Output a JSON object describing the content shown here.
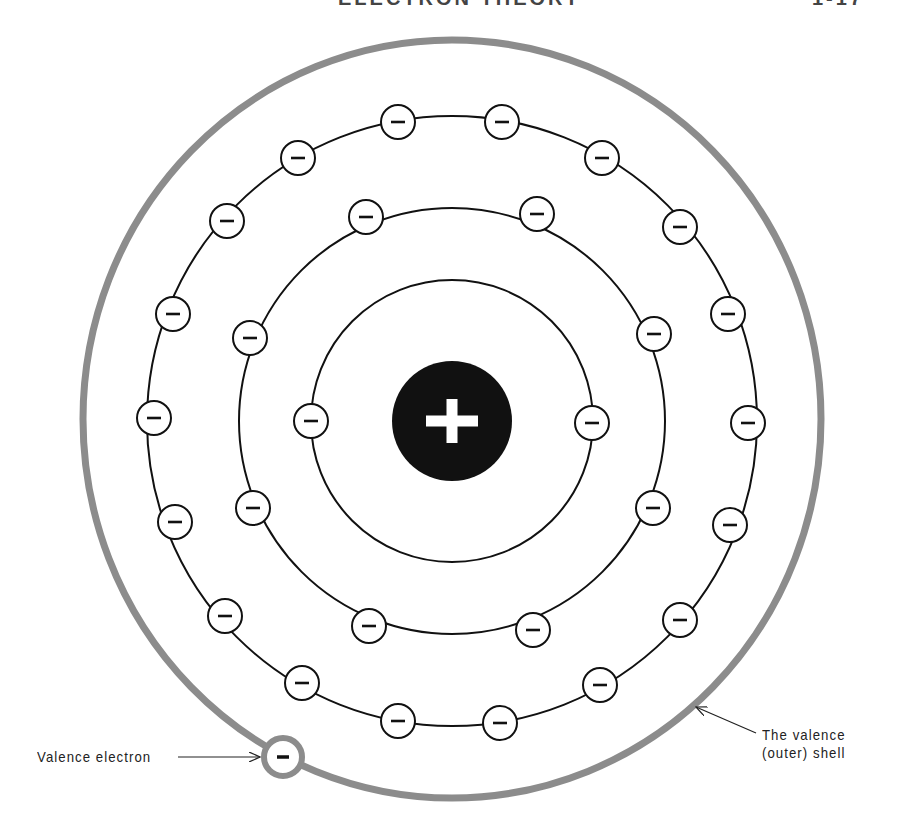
{
  "header": {
    "title": "ELECTRON THEORY",
    "page": "1-17"
  },
  "diagram": {
    "nucleus": {
      "cx": 452,
      "cy": 421,
      "r": 60,
      "symbol": "+",
      "fill": "#111111",
      "symbol_color": "#ffffff"
    },
    "shells": [
      {
        "name": "first-shell",
        "cx": 452,
        "cy": 421,
        "r": 141,
        "stroke": "#111111",
        "stroke_width": 2
      },
      {
        "name": "second-shell",
        "cx": 452,
        "cy": 421,
        "r": 213,
        "stroke": "#111111",
        "stroke_width": 2
      },
      {
        "name": "third-shell",
        "cx": 452,
        "cy": 421,
        "r": 305,
        "stroke": "#111111",
        "stroke_width": 2
      }
    ],
    "valence_shell": {
      "cx": 452,
      "cy": 419,
      "rx": 369,
      "ry": 379,
      "stroke": "#8c8c8c",
      "stroke_width": 7
    },
    "electron_radius": 17,
    "electron_symbol": "−",
    "electrons": {
      "first": [
        [
          311,
          421
        ],
        [
          592,
          423
        ]
      ],
      "second": [
        [
          366,
          217
        ],
        [
          537,
          214
        ],
        [
          250,
          338
        ],
        [
          654,
          334
        ],
        [
          253,
          508
        ],
        [
          653,
          508
        ],
        [
          369,
          626
        ],
        [
          533,
          630
        ]
      ],
      "third": [
        [
          398,
          122
        ],
        [
          502,
          122
        ],
        [
          298,
          158
        ],
        [
          602,
          158
        ],
        [
          227,
          221
        ],
        [
          680,
          227
        ],
        [
          173,
          314
        ],
        [
          728,
          314
        ],
        [
          154,
          418
        ],
        [
          748,
          423
        ],
        [
          175,
          522
        ],
        [
          730,
          525
        ],
        [
          225,
          616
        ],
        [
          680,
          620
        ],
        [
          302,
          683
        ],
        [
          600,
          685
        ],
        [
          398,
          721
        ],
        [
          500,
          723
        ]
      ]
    },
    "valence_electron": {
      "cx": 283,
      "cy": 757,
      "r": 19,
      "ring_color": "#8c8c8c",
      "ring_width": 6
    },
    "counts": {
      "first_shell": 2,
      "second_shell": 8,
      "third_shell": 18,
      "valence_shell": 1
    }
  },
  "labels": {
    "valence_electron": "Valence electron",
    "valence_shell_line1": "The valence",
    "valence_shell_line2": "(outer) shell"
  }
}
